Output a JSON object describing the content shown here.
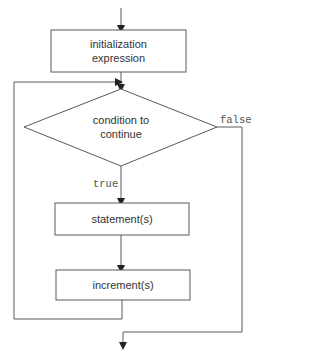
{
  "diagram": {
    "type": "flowchart",
    "nodes": {
      "init": {
        "shape": "rectangle",
        "label_line1": "initialization",
        "label_line2": "expression"
      },
      "condition": {
        "shape": "diamond",
        "label_line1": "condition to",
        "label_line2": "continue"
      },
      "statements": {
        "shape": "rectangle",
        "label": "statement(s)"
      },
      "increment": {
        "shape": "rectangle",
        "label": "increment(s)"
      }
    },
    "edges": {
      "true_label": "true",
      "false_label": "false"
    },
    "colors": {
      "line": "#5a5a5a",
      "text": "#333333",
      "background": "#ffffff"
    }
  }
}
